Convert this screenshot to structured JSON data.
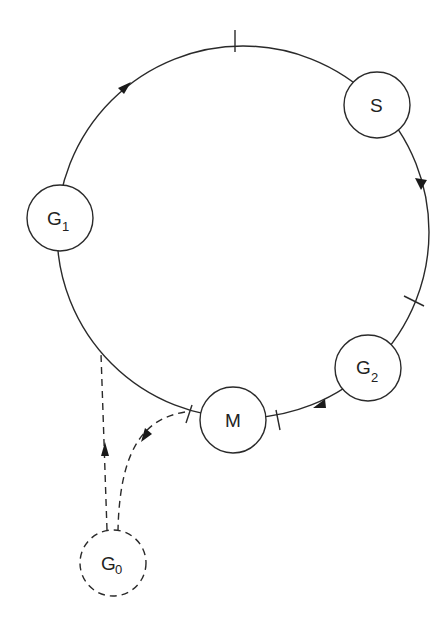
{
  "diagram": {
    "type": "cycle-diagram",
    "nodes": [
      {
        "id": "G1",
        "label": "G",
        "subscript": "1",
        "style": "solid"
      },
      {
        "id": "S",
        "label": "S",
        "subscript": "",
        "style": "solid"
      },
      {
        "id": "G2",
        "label": "G",
        "subscript": "2",
        "style": "solid"
      },
      {
        "id": "M",
        "label": "M",
        "subscript": "",
        "style": "solid"
      },
      {
        "id": "G0",
        "label": "G",
        "subscript": "0",
        "style": "dashed"
      }
    ],
    "edges": [
      {
        "from": "G1",
        "to": "S",
        "style": "solid",
        "direction": "clockwise"
      },
      {
        "from": "S",
        "to": "G2",
        "style": "solid",
        "direction": "clockwise"
      },
      {
        "from": "G2",
        "to": "M",
        "style": "solid",
        "direction": "clockwise"
      },
      {
        "from": "M",
        "to": "G1",
        "style": "solid",
        "direction": "clockwise"
      },
      {
        "from": "M",
        "to": "G0",
        "style": "dashed"
      },
      {
        "from": "G0",
        "to": "G1",
        "style": "dashed"
      }
    ],
    "checkpoints": 4
  }
}
